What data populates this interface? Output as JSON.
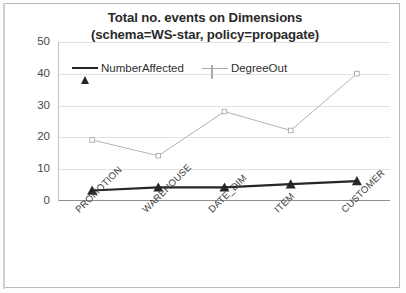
{
  "chart_data": {
    "type": "line",
    "title": "Total no. events on Dimensions (schema=WS-star, policy=propagate)",
    "title_line1": "Total no. events on Dimensions",
    "title_line2": "(schema=WS-star, policy=propagate)",
    "xlabel": "",
    "ylabel": "",
    "categories": [
      "PROMOTION",
      "WAREHOUSE",
      "DATE_DIM",
      "ITEM",
      "CUSTOMER"
    ],
    "yticks": [
      50,
      40,
      30,
      20,
      10,
      0
    ],
    "ylim": [
      0,
      50
    ],
    "grid": true,
    "legend_position": "top-left-inside",
    "series": [
      {
        "name": "NumberAffected",
        "values": [
          3,
          4,
          4,
          5,
          6
        ],
        "color": "#262626",
        "marker": "triangle"
      },
      {
        "name": "DegreeOut",
        "values": [
          19,
          14,
          28,
          22,
          40
        ],
        "color": "#aaaaaa",
        "marker": "square"
      }
    ]
  },
  "colors": {
    "series_number_affected": "#262626",
    "series_degree_out": "#aaaaaa",
    "gridline": "#e2e2e2",
    "axis": "#8f8f8f",
    "text": "#2a2a2a",
    "frame": "#b9b9b9"
  }
}
